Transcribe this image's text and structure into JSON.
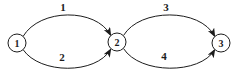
{
  "figure": {
    "type": "directed-graph",
    "background_color": "#ffffff",
    "line_color": "#1c1c1c",
    "nodes": [
      {
        "id": "node-1",
        "label": "1"
      },
      {
        "id": "node-2",
        "label": "2"
      },
      {
        "id": "node-3",
        "label": "3"
      }
    ],
    "edges": [
      {
        "id": "edge-1",
        "label": "1",
        "from": "1",
        "to": "2",
        "position": "top"
      },
      {
        "id": "edge-2",
        "label": "2",
        "from": "1",
        "to": "2",
        "position": "bottom"
      },
      {
        "id": "edge-3",
        "label": "3",
        "from": "2",
        "to": "3",
        "position": "top"
      },
      {
        "id": "edge-4",
        "label": "4",
        "from": "2",
        "to": "3",
        "position": "bottom"
      }
    ]
  }
}
